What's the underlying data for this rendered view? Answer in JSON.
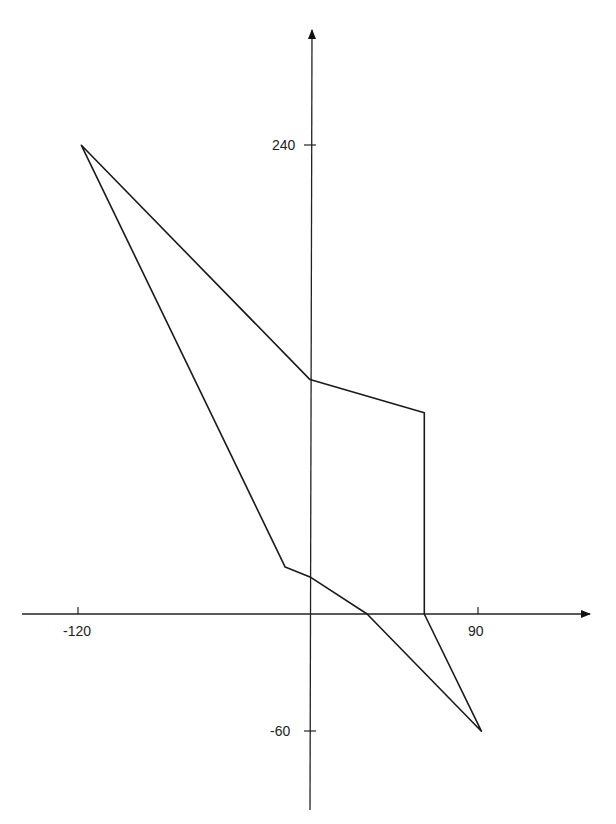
{
  "chart_data": {
    "type": "line",
    "title": "",
    "xlabel": "",
    "ylabel": "",
    "grid": false,
    "legend": null,
    "x_ticks": [
      -120,
      90
    ],
    "y_ticks": [
      240,
      -60
    ],
    "x_tick_labels": [
      "-120",
      "90"
    ],
    "y_tick_labels": [
      "240",
      "-60"
    ],
    "xlim": [
      -125,
      145
    ],
    "ylim": [
      -110,
      300
    ],
    "series": [
      {
        "name": "closed polygon",
        "closed": true,
        "points": [
          [
            -120,
            240
          ],
          [
            0,
            120
          ],
          [
            60,
            103
          ],
          [
            60,
            0
          ],
          [
            90,
            -60
          ],
          [
            30,
            0
          ],
          [
            0,
            19
          ],
          [
            -13,
            24
          ],
          [
            -120,
            240
          ]
        ]
      }
    ]
  },
  "labels": {
    "x_min": "-120",
    "x_max": "90",
    "y_max": "240",
    "y_min": "-60"
  }
}
